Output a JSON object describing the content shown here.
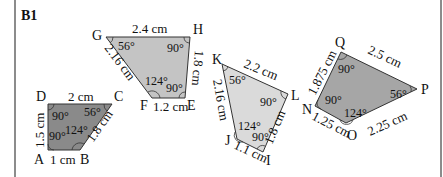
{
  "title": "B1",
  "colors": {
    "frame": "#8c8c8c",
    "stroke": "#333333",
    "text": "#111111"
  },
  "shapes": [
    {
      "id": "ABCD",
      "fill": "#8a8a8a",
      "vertices": {
        "A": "A",
        "B": "B",
        "C": "C",
        "D": "D"
      },
      "sides": {
        "AB": "1 cm",
        "BC": "1.8 cm",
        "CD": "2 cm",
        "DA": "1.5 cm"
      },
      "angles": {
        "A": "90°",
        "B": "124°",
        "C": "56°",
        "D": "90°"
      }
    },
    {
      "id": "EFGH",
      "fill": "#c4c4c4",
      "vertices": {
        "E": "E",
        "F": "F",
        "G": "G",
        "H": "H"
      },
      "sides": {
        "EF": "1.2 cm",
        "FG": "2.16 cm",
        "GH": "2.4 cm",
        "HE": "1.8 cm"
      },
      "angles": {
        "E": "90°",
        "F": "124°",
        "G": "56°",
        "H": "90°"
      }
    },
    {
      "id": "IJKL",
      "fill": "#dadada",
      "vertices": {
        "I": "I",
        "J": "J",
        "K": "K",
        "L": "L"
      },
      "sides": {
        "IJ": "1.1 cm",
        "JK": "2.16 cm",
        "KL": "2.2 cm",
        "LI": "1.8 cm"
      },
      "angles": {
        "I": "90°",
        "J": "124°",
        "K": "56°",
        "L": "90°"
      }
    },
    {
      "id": "NOPQ",
      "fill": "#a6a6a6",
      "vertices": {
        "N": "N",
        "O": "O",
        "P": "P",
        "Q": "Q"
      },
      "sides": {
        "NO": "1.25 cm",
        "OP": "2.25 cm",
        "PQ": "2.5 cm",
        "QN": "1.875 cm"
      },
      "angles": {
        "N": "90°",
        "O": "124°",
        "P": "56°",
        "Q": "90°"
      }
    }
  ]
}
